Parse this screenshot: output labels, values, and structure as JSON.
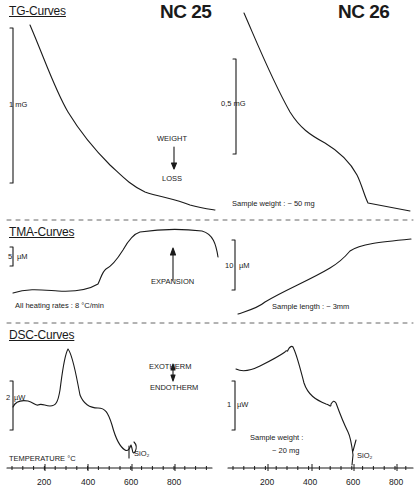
{
  "titles": {
    "left": "NC 25",
    "right": "NC 26"
  },
  "sections": {
    "tg": "TG-Curves",
    "tma": "TMA-Curves",
    "dsc": "DSC-Curves"
  },
  "annotations": {
    "tg_scale_left": "1 mG",
    "tg_scale_right": "0,5 mG",
    "weight": "WEIGHT",
    "loss": "LOSS",
    "tg_sample_weight": "Sample weight  :  ~ 50 mg",
    "tma_scale_left": "5",
    "tma_scale_left_unit": "µM",
    "tma_scale_right": "10",
    "tma_scale_right_unit": "µM",
    "expansion": "EXPANSION",
    "heating_rates": "All heating rates   :    8 °C/min",
    "sample_length": "Sample length   :  ~ 3mm",
    "exotherm": "EXOTHERM",
    "endotherm": "ENDOTHERM",
    "dsc_scale_left": "2",
    "dsc_scale_left_unit": "µW",
    "dsc_scale_right": "1",
    "dsc_scale_right_unit": "µW",
    "dsc_sample_weight_line1": "Sample  weight :",
    "dsc_sample_weight_line2": "~ 20 mg",
    "sio2_left": "SiO₂",
    "sio2_right": "SiO₂",
    "xlabel": "TEMPERATURE   °C"
  },
  "axis": {
    "ticks": [
      "200",
      "400",
      "600",
      "800"
    ]
  },
  "chart_data": [
    {
      "type": "line",
      "title": "TG-Curves NC 25",
      "xlabel": "Temperature (°C)",
      "ylabel": "Weight (scale bar 1 mG)",
      "x": [
        50,
        100,
        150,
        200,
        250,
        300,
        350,
        400,
        450,
        500,
        550,
        600,
        650,
        700,
        800,
        900
      ],
      "series": [
        {
          "name": "NC 25 TG (relative weight, mG)",
          "values": [
            1.6,
            1.35,
            1.15,
            1.0,
            0.85,
            0.7,
            0.55,
            0.4,
            0.25,
            0.17,
            0.14,
            0.12,
            0.1,
            0.08,
            0.05,
            0.03
          ]
        }
      ],
      "annotations": [
        "WEIGHT ↓ LOSS"
      ]
    },
    {
      "type": "line",
      "title": "TG-Curves NC 26",
      "xlabel": "Temperature (°C)",
      "ylabel": "Weight (scale bar 0,5 mG)",
      "x": [
        50,
        100,
        150,
        200,
        250,
        300,
        350,
        400,
        450,
        500,
        550,
        600,
        700,
        800
      ],
      "series": [
        {
          "name": "NC 26 TG (relative weight, mG)",
          "values": [
            0.95,
            0.85,
            0.73,
            0.6,
            0.48,
            0.38,
            0.33,
            0.3,
            0.26,
            0.22,
            0.15,
            0.03,
            0.02,
            0.01
          ]
        }
      ],
      "annotations": [
        "Sample weight : ~50 mg"
      ]
    },
    {
      "type": "line",
      "title": "TMA-Curves NC 25",
      "xlabel": "Temperature (°C)",
      "ylabel": "Length change (scale bar 5 µM)",
      "x": [
        50,
        100,
        200,
        300,
        350,
        400,
        450,
        500,
        600,
        700,
        800,
        900,
        950
      ],
      "series": [
        {
          "name": "NC 25 TMA (µM)",
          "values": [
            0,
            1,
            0.5,
            1.5,
            3,
            5.5,
            9,
            14,
            17,
            17.5,
            17.5,
            17,
            10
          ]
        }
      ],
      "annotations": [
        "EXPANSION ↑",
        "All heating rates : 8 °C/min"
      ]
    },
    {
      "type": "line",
      "title": "TMA-Curves NC 26",
      "xlabel": "Temperature (°C)",
      "ylabel": "Length change (scale bar 10 µM)",
      "x": [
        50,
        100,
        200,
        300,
        400,
        500,
        550,
        600,
        700,
        800,
        850
      ],
      "series": [
        {
          "name": "NC 26 TMA (µM)",
          "values": [
            0,
            2,
            6,
            10,
            14,
            18,
            21,
            23.5,
            25,
            26.5,
            27
          ]
        }
      ],
      "annotations": [
        "Sample length : ~3mm"
      ]
    },
    {
      "type": "line",
      "title": "DSC-Curves NC 25",
      "xlabel": "TEMPERATURE °C",
      "ylabel": "Heat flow (scale bar 2 µW)",
      "x": [
        50,
        100,
        150,
        200,
        250,
        280,
        300,
        320,
        350,
        400,
        450,
        500,
        550,
        573,
        600
      ],
      "series": [
        {
          "name": "NC 25 DSC (µW, exo up)",
          "values": [
            0,
            0.2,
            0.1,
            0,
            0.8,
            2.5,
            2.4,
            1.5,
            0.2,
            -0.6,
            -0.7,
            -1.2,
            -2.2,
            -2.6,
            -2.3
          ]
        }
      ],
      "annotations": [
        "EXOTHERM ↑ / ENDOTHERM ↓",
        "SiO₂ (~573 °C)"
      ]
    },
    {
      "type": "line",
      "title": "DSC-Curves NC 26",
      "xlabel": "Temperature (°C)",
      "ylabel": "Heat flow (scale bar 1 µW)",
      "x": [
        50,
        100,
        200,
        250,
        270,
        300,
        350,
        400,
        450,
        480,
        500,
        530,
        560,
        573,
        580
      ],
      "series": [
        {
          "name": "NC 26 DSC (µW, exo up)",
          "values": [
            0,
            -0.05,
            0.3,
            0.45,
            0.5,
            0.1,
            -0.7,
            -0.9,
            -1.1,
            -1.05,
            -1.3,
            -1.6,
            -2.0,
            -2.5,
            -1.9
          ]
        }
      ],
      "annotations": [
        "Sample weight : ~20 mg",
        "SiO₂ (~573 °C)"
      ]
    }
  ],
  "layout": {
    "x_axis_left": {
      "range": [
        0,
        950
      ],
      "ticks": [
        200,
        400,
        600,
        800
      ]
    },
    "x_axis_right": {
      "range": [
        0,
        850
      ],
      "ticks": [
        200,
        400,
        600,
        800
      ]
    },
    "grid": false,
    "line_color": "#1a1a1a"
  }
}
